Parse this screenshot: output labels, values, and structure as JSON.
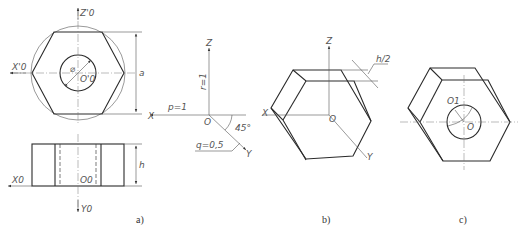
{
  "figure_a": {
    "axis_z": "Z'0",
    "axis_x_top": "X'0",
    "center_top": "O'0",
    "diameter_symbol": "⌀",
    "dim_a": "a",
    "axis_x_bottom": "X0",
    "center_bottom": "O0",
    "axis_y": "Y0",
    "dim_h": "h",
    "caption": "a)"
  },
  "axes_diagram": {
    "z": "Z",
    "x": "X",
    "y": "Y",
    "origin": "O",
    "r": "r=1",
    "p": "p=1",
    "q": "q=0,5",
    "angle": "45°"
  },
  "figure_b": {
    "z": "Z",
    "x": "X",
    "y": "Y",
    "origin": "O",
    "dim": "h/2",
    "caption": "b)"
  },
  "figure_c": {
    "center_top": "O1",
    "origin": "O",
    "caption": "c)"
  }
}
